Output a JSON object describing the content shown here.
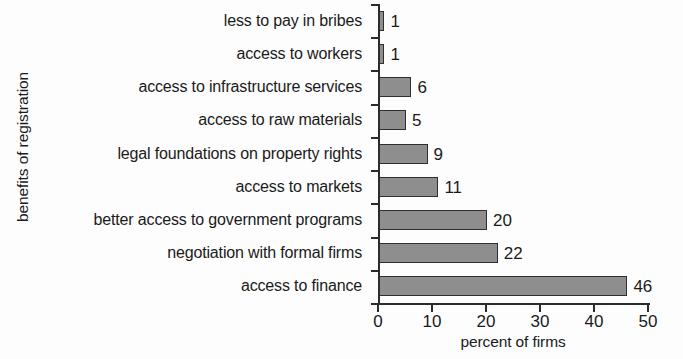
{
  "chart_data": {
    "type": "bar",
    "orientation": "horizontal",
    "title": "",
    "xlabel": "percent of firms",
    "ylabel": "benefits of registration",
    "xlim": [
      0,
      50
    ],
    "xticks": [
      0,
      10,
      20,
      30,
      40,
      50
    ],
    "grid": false,
    "legend": null,
    "bar_color": "#8e8e8e",
    "bar_edge_color": "#2f2f2f",
    "axis_color": "#2b2b2b",
    "categories": [
      "less to pay in bribes",
      "access to workers",
      "access to infrastructure services",
      "access to raw materials",
      "legal foundations on property rights",
      "access to markets",
      "better access to government programs",
      "negotiation with formal firms",
      "access to finance"
    ],
    "values": [
      1,
      1,
      6,
      5,
      9,
      11,
      20,
      22,
      46
    ],
    "value_labels": [
      "1",
      "1",
      "6",
      "5",
      "9",
      "11",
      "20",
      "22",
      "46"
    ],
    "xtick_labels": [
      "0",
      "10",
      "20",
      "30",
      "40",
      "50"
    ]
  }
}
